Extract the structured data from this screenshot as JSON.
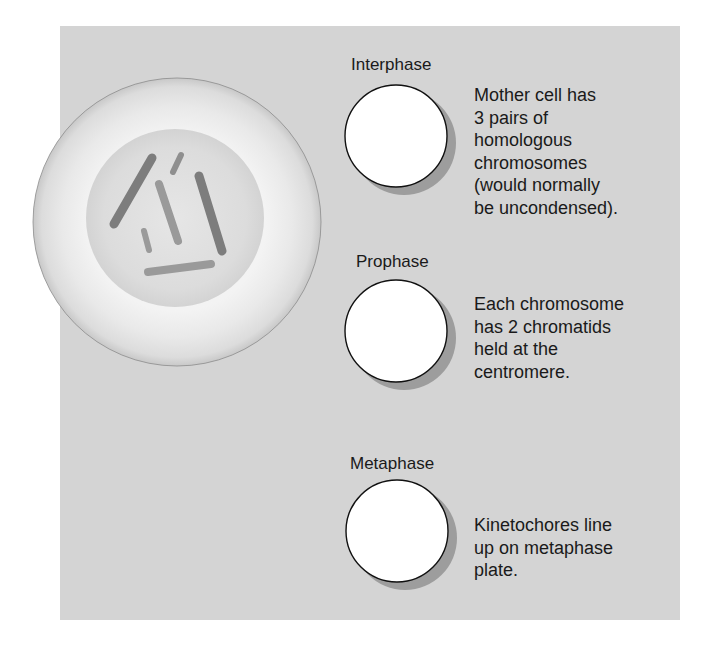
{
  "figure": {
    "background_color": "#d4d4d4",
    "cell": {
      "outer_color": "#ebebeb",
      "nucleus_color": "#d9d9d9",
      "chromosome_count": 6,
      "chromosome_colors": [
        "#858585",
        "#a3a3a3"
      ]
    }
  },
  "phases": [
    {
      "label": "Interphase",
      "description": "Mother cell has\n3 pairs of\nhomologous\nchromosomes\n(would normally\nbe uncondensed).",
      "circle": "empty-white-circle"
    },
    {
      "label": "Prophase",
      "description": "Each chromosome\nhas 2 chromatids\nheld at the\ncentromere.",
      "circle": "empty-white-circle"
    },
    {
      "label": "Metaphase",
      "description": "Kinetochores line\nup on metaphase\nplate.",
      "circle": "empty-white-circle"
    }
  ]
}
